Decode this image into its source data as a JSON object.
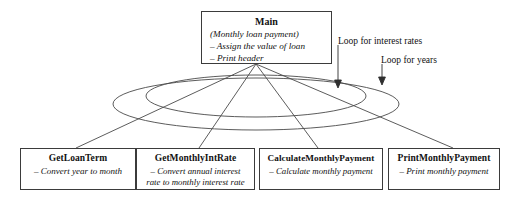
{
  "diagram": {
    "type": "structure-chart",
    "main": {
      "title": "Main",
      "lines": [
        "(Monthly loan payment)",
        "– Assign the value of loan",
        "– Print header"
      ]
    },
    "modules": [
      {
        "title": "GetLoanTerm",
        "lines": [
          "– Convert year to month"
        ]
      },
      {
        "title": "GetMonthlyIntRate",
        "lines": [
          "– Convert annual interest",
          "rate to monthly interest rate"
        ]
      },
      {
        "title": "CalculateMonthlyPayment",
        "lines": [
          "– Calculate monthly payment"
        ]
      },
      {
        "title": "PrintMonthlyPayment",
        "lines": [
          "– Print monthly payment"
        ]
      }
    ],
    "loops": [
      {
        "label": "Loop for interest rates"
      },
      {
        "label": "Loop for years"
      }
    ],
    "colors": {
      "line": "#3b3b3b",
      "text": "#111111",
      "background": "#ffffff"
    }
  }
}
